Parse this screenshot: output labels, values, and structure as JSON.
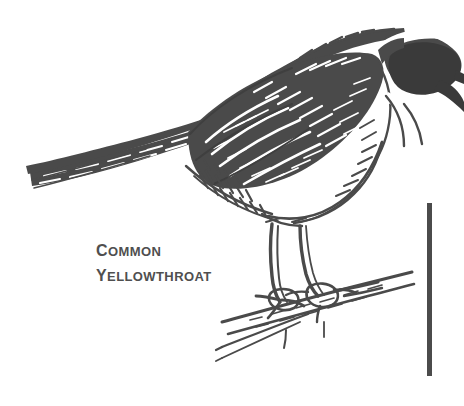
{
  "plate": {
    "kind": "pen-and-ink-illustration",
    "subject": "perched songbird",
    "species_common_name": "Common Yellowthroat",
    "background_color": "#ffffff",
    "ink_color": "#4a4a4a",
    "ink_color_dark": "#3c3c3c",
    "caption": {
      "line1_first_letter": "C",
      "line1_rest": "OMMON",
      "line1_full": "COMMON",
      "line2_first_letter": "Y",
      "line2_rest": "ELLOWTHROAT",
      "line2_full": "YELLOWTHROAT",
      "color": "#4f4f4f"
    },
    "rule": {
      "name": "vertical-rule",
      "color": "#4b4b4b",
      "x": 427,
      "y": 203,
      "width": 5,
      "height": 173
    },
    "elements": {
      "tail": "tail",
      "wing": "wing",
      "back": "back",
      "crown": "crown",
      "face_mask": "black face mask",
      "beak": "beak",
      "throat": "throat",
      "breast": "breast",
      "belly": "belly",
      "legs": "legs",
      "feet": "feet",
      "branch": "perch branch",
      "twigs": "twigs"
    }
  }
}
